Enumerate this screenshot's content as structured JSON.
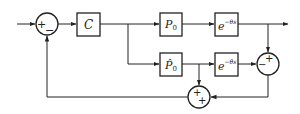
{
  "diagram": {
    "type": "block-diagram",
    "blocks": {
      "controller": {
        "label": "C"
      },
      "plant": {
        "label": "P",
        "sub": "0"
      },
      "plant_delay": {
        "label": "e",
        "sup": "−θs"
      },
      "model": {
        "label": "P̂",
        "sub": "0"
      },
      "model_delay": {
        "label": "e",
        "sup": "−θ̂s"
      }
    },
    "summers": {
      "input_sum": {
        "signs": [
          "+",
          "−"
        ]
      },
      "error_sum": {
        "signs": [
          "+",
          "−"
        ]
      },
      "feedback_sum": {
        "signs": [
          "+",
          "+"
        ]
      }
    },
    "connections": [
      "input -> input_sum(+)",
      "input_sum -> controller",
      "controller -> plant",
      "controller -> model",
      "plant -> plant_delay",
      "plant_delay -> output",
      "plant_delay -> error_sum(+)",
      "model -> model_delay",
      "model_delay -> error_sum(−)",
      "model -> feedback_sum(+)",
      "error_sum -> feedback_sum(+)",
      "feedback_sum -> input_sum(−)"
    ]
  }
}
